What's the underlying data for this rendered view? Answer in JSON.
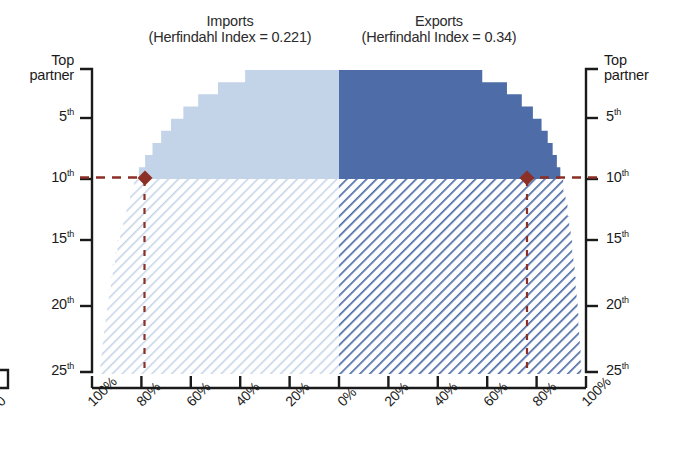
{
  "chart_data": {
    "type": "area",
    "title": "",
    "panels": [
      {
        "name": "imports",
        "title": "Imports",
        "subtitle": "(Herfindahl Index = 0.221)",
        "herfindahl_index": 0.221,
        "side": "left",
        "fill_color": "#c3d3e8",
        "hatch_color": "#bed0e6",
        "xlabel": "",
        "cumulative_share_percent": [
          38,
          49,
          57,
          63,
          68,
          72,
          75.5,
          78.5,
          81,
          83,
          84.6,
          86.1,
          87.4,
          88.6,
          89.7,
          90.7,
          91.6,
          92.4,
          93.2,
          93.9,
          94.5,
          95.1,
          95.6,
          96.1,
          96.6
        ],
        "partner_ranks": [
          1,
          2,
          3,
          4,
          5,
          6,
          7,
          8,
          9,
          10,
          11,
          12,
          13,
          14,
          15,
          16,
          17,
          18,
          19,
          20,
          21,
          22,
          23,
          24,
          25
        ],
        "marker_rank": 10,
        "marker_share_percent": 81
      },
      {
        "name": "exports",
        "title": "Exports",
        "subtitle": "(Herfindahl Index = 0.34)",
        "herfindahl_index": 0.34,
        "side": "right",
        "fill_color": "#4d6ca8",
        "hatch_color": "#4d6ca8",
        "xlabel": "",
        "cumulative_share_percent": [
          58,
          68,
          74,
          78.5,
          82,
          84.5,
          86.5,
          88.2,
          89.6,
          90.8,
          91.7,
          92.5,
          93.2,
          93.8,
          94.4,
          94.9,
          95.4,
          95.8,
          96.2,
          96.6,
          96.9,
          97.2,
          97.5,
          97.8,
          98.1
        ],
        "partner_ranks": [
          1,
          2,
          3,
          4,
          5,
          6,
          7,
          8,
          9,
          10,
          11,
          12,
          13,
          14,
          15,
          16,
          17,
          18,
          19,
          20,
          21,
          22,
          23,
          24,
          25
        ],
        "marker_rank": 10,
        "marker_share_percent": 90.8
      }
    ],
    "y_axis": {
      "label_top": "Top\npartner",
      "label_top_line1": "Top",
      "label_top_line2": "partner",
      "tick_labels": [
        "5th",
        "10th",
        "15th",
        "20th",
        "25th"
      ],
      "tick_values": [
        5,
        10,
        15,
        20,
        25
      ],
      "range": [
        1,
        25
      ],
      "direction": "top-to-bottom",
      "mirrored": true
    },
    "x_axis": {
      "tick_labels": [
        "100%",
        "80%",
        "60%",
        "40%",
        "20%",
        "0%",
        "20%",
        "40%",
        "60%",
        "80%",
        "100%"
      ],
      "tick_values": [
        100,
        80,
        60,
        40,
        20,
        0,
        20,
        40,
        60,
        80,
        100
      ],
      "left_range": [
        100,
        0
      ],
      "right_range": [
        0,
        100
      ],
      "clipped_edge_label": "0"
    },
    "annotations": {
      "marker_color": "#8c2f26",
      "marker_shape": "diamond",
      "guide_line_style": "dashed",
      "guide_rank": 10,
      "left_marker_label": "80%",
      "right_marker_label": "80%"
    },
    "grid": false,
    "legend": "none"
  },
  "y_labels": {
    "top_partner_line1": "Top",
    "top_partner_line2": "partner",
    "t5": "5",
    "t5sup": "th",
    "t10": "10",
    "t10sup": "th",
    "t15": "15",
    "t15sup": "th",
    "t20": "20",
    "t20sup": "th",
    "t25": "25",
    "t25sup": "th"
  },
  "x_labels": {
    "x0": "100%",
    "x1": "80%",
    "x2": "60%",
    "x3": "40%",
    "x4": "20%",
    "x5": "0%",
    "x6": "20%",
    "x7": "40%",
    "x8": "60%",
    "x9": "80%",
    "x10": "100%",
    "clipped": "0"
  },
  "panel_titles": {
    "imports_main": "Imports",
    "imports_sub": "(Herfindahl Index = 0.221)",
    "exports_main": "Exports",
    "exports_sub": "(Herfindahl Index = 0.34)"
  },
  "colors": {
    "imports_fill": "#c3d3e8",
    "exports_fill": "#4d6ca8",
    "marker": "#8c2f26",
    "axis": "#1a1a1a"
  }
}
